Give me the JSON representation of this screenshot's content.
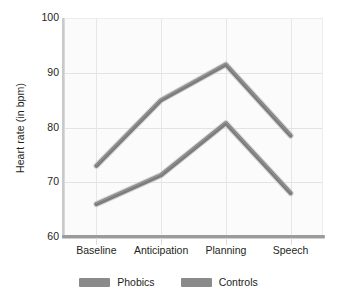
{
  "chart_data": {
    "type": "line",
    "title": "",
    "subtitle": "",
    "xlabel": "",
    "ylabel": "Heart rate (in bpm)",
    "categories": [
      "Baseline",
      "Anticipation",
      "Planning",
      "Speech"
    ],
    "series": [
      {
        "name": "Phobics",
        "values": [
          73.0,
          85.0,
          91.5,
          78.5
        ],
        "color": "#7d7d7d"
      },
      {
        "name": "Controls",
        "values": [
          66.0,
          71.3,
          80.8,
          68.0
        ],
        "color": "#7d7d7d"
      }
    ],
    "ylim": [
      60,
      100
    ],
    "yticks": [
      60,
      70,
      80,
      90,
      100
    ],
    "ytick_labels": [
      "60",
      "70",
      "80",
      "90",
      "100"
    ],
    "grid": true,
    "grid_color": "#e3e3e3",
    "plot_background": "#fbfbfb",
    "legend_position": "bottom",
    "legend": [
      {
        "label": "Phobics",
        "swatch_color": "#8a8a8a"
      },
      {
        "label": "Controls",
        "swatch_color": "#8a8a8a"
      }
    ],
    "line_color": "#7d7d7d",
    "line_width": 4,
    "text_color": "#231f20"
  }
}
